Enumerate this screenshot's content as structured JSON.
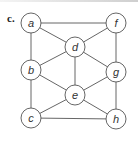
{
  "figure": {
    "panel_label": "c.",
    "nodes": [
      {
        "id": "a",
        "x": 31,
        "y": 23
      },
      {
        "id": "f",
        "x": 116,
        "y": 23
      },
      {
        "id": "d",
        "x": 75,
        "y": 47
      },
      {
        "id": "b",
        "x": 31,
        "y": 70
      },
      {
        "id": "g",
        "x": 116,
        "y": 72
      },
      {
        "id": "e",
        "x": 75,
        "y": 95
      },
      {
        "id": "c",
        "x": 31,
        "y": 118
      },
      {
        "id": "h",
        "x": 116,
        "y": 119
      }
    ],
    "edges": [
      [
        "a",
        "f"
      ],
      [
        "a",
        "d"
      ],
      [
        "a",
        "b"
      ],
      [
        "f",
        "d"
      ],
      [
        "f",
        "g"
      ],
      [
        "d",
        "b"
      ],
      [
        "d",
        "g"
      ],
      [
        "d",
        "e"
      ],
      [
        "b",
        "e"
      ],
      [
        "b",
        "c"
      ],
      [
        "g",
        "e"
      ],
      [
        "g",
        "h"
      ],
      [
        "e",
        "c"
      ],
      [
        "e",
        "h"
      ],
      [
        "c",
        "h"
      ]
    ],
    "node_radius": 10,
    "colors": {
      "stroke": "#555555",
      "fill": "#ffffff",
      "text": "#333333"
    }
  }
}
